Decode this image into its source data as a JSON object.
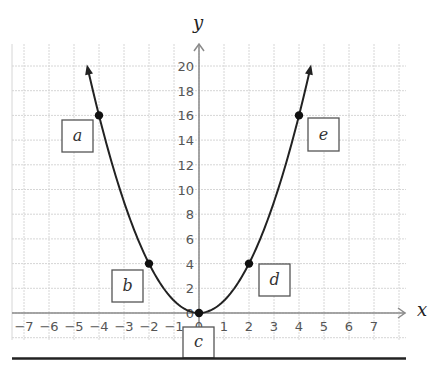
{
  "chart_data": {
    "type": "line",
    "title": "",
    "function": "y = x^2",
    "xlabel": "x",
    "ylabel": "y",
    "xlim": [
      -7,
      7
    ],
    "ylim": [
      0,
      20
    ],
    "grid": true,
    "x_ticks": [
      "-7",
      "-6",
      "-5",
      "-4",
      "-3",
      "-2",
      "-1",
      "0",
      "1",
      "2",
      "3",
      "4",
      "5",
      "6",
      "7"
    ],
    "y_ticks": [
      "0",
      "2",
      "4",
      "6",
      "8",
      "10",
      "12",
      "14",
      "16",
      "18",
      "20"
    ],
    "series": [
      {
        "name": "parabola",
        "x": [
          -4.5,
          -4,
          -3,
          -2,
          -1,
          0,
          1,
          2,
          3,
          4,
          4.5
        ],
        "y": [
          20.25,
          16,
          9,
          4,
          1,
          0,
          1,
          4,
          9,
          16,
          20.25
        ]
      }
    ],
    "points": [
      {
        "label": "a",
        "x": -4,
        "y": 16
      },
      {
        "label": "b",
        "x": -2,
        "y": 4
      },
      {
        "label": "c",
        "x": 0,
        "y": 0
      },
      {
        "label": "d",
        "x": 2,
        "y": 4
      },
      {
        "label": "e",
        "x": 4,
        "y": 16
      }
    ]
  },
  "labels": {
    "x_axis": "x",
    "y_axis": "y",
    "box_a": "a",
    "box_b": "b",
    "box_c": "c",
    "box_d": "d",
    "box_e": "e"
  },
  "colors": {
    "grid": "#d6d6d6",
    "axis": "#8a8a8a",
    "curve": "#222222",
    "point": "#111111",
    "box_border": "#555555"
  }
}
